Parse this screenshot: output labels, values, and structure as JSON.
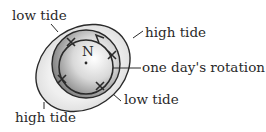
{
  "diagram": {
    "center_label": "N",
    "labels": {
      "low_tide_top": "low tide",
      "high_tide_right": "high tide",
      "rotation": "one day's rotation",
      "low_tide_bottom": "low tide",
      "high_tide_bottom": "high tide"
    },
    "colors": {
      "ink": "#2a2a2a",
      "earth_light": "#f4f4f4",
      "earth_dark": "#7a7a7a",
      "bulge_fill": "#e6e6e6"
    }
  }
}
